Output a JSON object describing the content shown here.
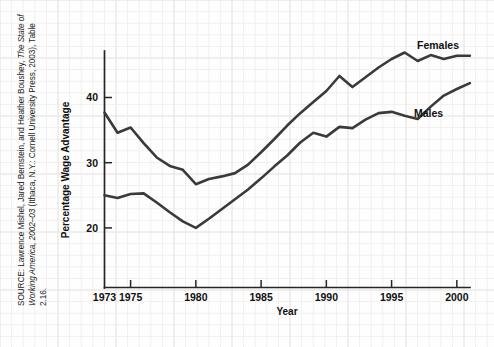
{
  "figure": {
    "background_color": "#fefefe",
    "line_color": "#3a3a3a",
    "axis_color": "#262626",
    "source_note_line1": "SOURCE: Lawrence Mishel, Jared Bernstein, and Heather Boushey, ",
    "source_note_italic1": "The",
    "source_note_italic2": "State of Working America, 2002–03",
    "source_note_line2": " (Ithaca, N.Y.: Cornell University Press,",
    "source_note_line3": "2003), Table 2.16."
  },
  "chart_data": {
    "type": "line",
    "title": "",
    "xlabel": "Year",
    "ylabel": "Percentage Wage Advantage",
    "xlim": [
      1972,
      2001.5
    ],
    "ylim": [
      13.5,
      49.5
    ],
    "grid": true,
    "legend_position": "inline-right",
    "xtick_labels": [
      "1973",
      "1975",
      "1980",
      "1985",
      "1990",
      "1995",
      "2000"
    ],
    "xtick_values": [
      1973,
      1975,
      1980,
      1985,
      1990,
      1995,
      2000
    ],
    "ytick_labels": [
      "20",
      "30",
      "40"
    ],
    "ytick_values": [
      20,
      30,
      40
    ],
    "x": [
      1973,
      1974,
      1975,
      1976,
      1977,
      1978,
      1979,
      1980,
      1981,
      1982,
      1983,
      1984,
      1985,
      1986,
      1987,
      1988,
      1989,
      1990,
      1991,
      1992,
      1993,
      1994,
      1995,
      1996,
      1997,
      1998,
      1999,
      2000,
      2001
    ],
    "series": [
      {
        "name": "Females",
        "label": "Females",
        "values": [
          37.7,
          34.6,
          35.4,
          33.0,
          30.8,
          29.5,
          28.9,
          26.7,
          27.5,
          27.9,
          28.4,
          29.7,
          31.6,
          33.6,
          35.7,
          37.6,
          39.3,
          41.0,
          43.3,
          41.6,
          43.1,
          44.6,
          45.9,
          46.9,
          45.6,
          46.5,
          45.9,
          46.4,
          46.4
        ]
      },
      {
        "name": "Males",
        "label": "Males",
        "values": [
          25.0,
          24.6,
          25.2,
          25.3,
          23.9,
          22.4,
          21.0,
          20.0,
          21.4,
          22.9,
          24.4,
          25.9,
          27.6,
          29.4,
          31.1,
          33.1,
          34.6,
          34.0,
          35.5,
          35.3,
          36.6,
          37.6,
          37.8,
          37.2,
          36.7,
          38.6,
          40.3,
          41.3,
          42.2
        ]
      }
    ]
  }
}
